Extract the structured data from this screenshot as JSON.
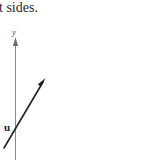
{
  "caption": {
    "text": "t sides."
  },
  "diagram": {
    "axis": {
      "label": "y",
      "color": "#8a8a8a"
    },
    "vector": {
      "label": "u",
      "color": "#222222"
    }
  }
}
